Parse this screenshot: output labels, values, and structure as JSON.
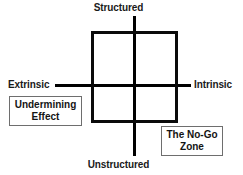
{
  "diagram": {
    "axes": {
      "top_label": "Structured",
      "bottom_label": "Unstructured",
      "left_label": "Extrinsic",
      "right_label": "Intrinsic"
    },
    "callouts": [
      {
        "label": "Undermining Effect"
      },
      {
        "label": "The No-Go Zone"
      }
    ],
    "colors": {
      "background": "#ffffff",
      "axis": "#000000",
      "square_border": "#0a0a0a",
      "callout_border": "#6e6e6e",
      "text": "#1a1a1a"
    }
  }
}
